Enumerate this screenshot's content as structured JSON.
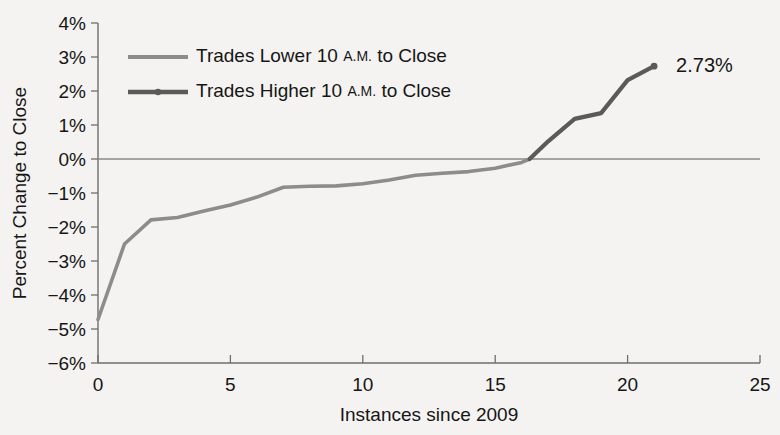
{
  "chart_data": {
    "type": "line",
    "title": "",
    "xlabel": "Instances since 2009",
    "ylabel": "Percent Change to Close",
    "xlim": [
      0,
      25
    ],
    "ylim": [
      -6,
      4
    ],
    "xticks": [
      0,
      5,
      10,
      15,
      20,
      25
    ],
    "xticklabels": [
      "0",
      "5",
      "10",
      "15",
      "20",
      "25"
    ],
    "yticks": [
      4,
      3,
      2,
      1,
      0,
      -1,
      -2,
      -3,
      -4,
      -5,
      -6
    ],
    "yticklabels": [
      "4%",
      "3%",
      "2%",
      "1%",
      "0%",
      "-1%",
      "-2%",
      "-3%",
      "-4%",
      "-5%",
      "-6%"
    ],
    "grid": false,
    "zero_line": true,
    "legend_position": "top-left",
    "series": [
      {
        "name": "Trades Lower 10 A.M. to Close",
        "color": "#8c8c8c",
        "x": [
          0,
          1,
          2,
          3,
          4,
          5,
          6,
          7,
          8,
          9,
          10,
          11,
          12,
          13,
          14,
          15,
          16,
          16.3
        ],
        "values": [
          -4.72,
          -2.5,
          -1.79,
          -1.72,
          -1.53,
          -1.35,
          -1.12,
          -0.83,
          -0.8,
          -0.79,
          -0.73,
          -0.62,
          -0.48,
          -0.42,
          -0.37,
          -0.27,
          -0.1,
          0.0
        ]
      },
      {
        "name": "Trades Higher 10 A.M. to Close",
        "color": "#5a5a5a",
        "x": [
          16.3,
          17,
          18,
          19,
          20,
          21
        ],
        "values": [
          0.0,
          0.52,
          1.18,
          1.35,
          2.32,
          2.73
        ]
      }
    ],
    "annotations": [
      {
        "text": "2.73%",
        "x": 21,
        "y": 2.73,
        "dx": 22,
        "dy": 6
      }
    ]
  },
  "legend": {
    "items": [
      {
        "prefix": "Trades Lower 10 ",
        "smallcaps": "A.M.",
        "suffix": " to Close",
        "color": "#8c8c8c"
      },
      {
        "prefix": "Trades Higher 10 ",
        "smallcaps": "A.M.",
        "suffix": " to Close",
        "color": "#5a5a5a"
      }
    ]
  }
}
